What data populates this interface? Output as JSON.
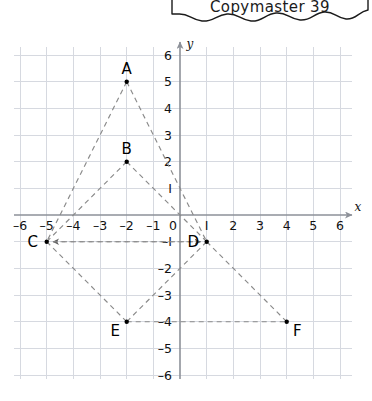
{
  "header": {
    "title": "Copymaster 39",
    "shape": "torn-paper-banner"
  },
  "graph": {
    "axis_labels": {
      "x": "x",
      "y": "y"
    },
    "x_axis": {
      "min": -6,
      "max": 6,
      "ticks": [
        "–6",
        "–5",
        "–4",
        "–3",
        "–2",
        "–1",
        "0",
        "I",
        "2",
        "3",
        "4",
        "5",
        "6"
      ],
      "tick_values": [
        -6,
        -5,
        -4,
        -3,
        -2,
        -1,
        0,
        1,
        2,
        3,
        4,
        5,
        6
      ]
    },
    "y_axis": {
      "min": -6,
      "max": 6,
      "ticks": [
        "6",
        "5",
        "4",
        "3",
        "2",
        "I",
        "–I",
        "–2",
        "–3",
        "–4",
        "–5",
        "–6"
      ],
      "tick_values": [
        6,
        5,
        4,
        3,
        2,
        1,
        -1,
        -2,
        -3,
        -4,
        -5,
        -6
      ]
    },
    "colors": {
      "grid": "#d6d9e0",
      "axis": "#8d9199",
      "dashed_line": "#8a8a8a",
      "point": "#000000",
      "text": "#111111"
    },
    "points": [
      {
        "label": "A",
        "x": -2,
        "y": 5,
        "label_pos": "above"
      },
      {
        "label": "B",
        "x": -2,
        "y": 2,
        "label_pos": "above"
      },
      {
        "label": "C",
        "x": -5,
        "y": -1,
        "label_pos": "left"
      },
      {
        "label": "D",
        "x": 1,
        "y": -1,
        "label_pos": "left"
      },
      {
        "label": "E",
        "x": -2,
        "y": -4,
        "label_pos": "below-left"
      },
      {
        "label": "F",
        "x": 4,
        "y": -4,
        "label_pos": "below-right"
      }
    ],
    "segments": [
      {
        "from": "A",
        "to": "C",
        "arrows": "none"
      },
      {
        "from": "A",
        "to": "D",
        "arrows": "none"
      },
      {
        "from": "B",
        "to": "C",
        "arrows": "none"
      },
      {
        "from": "B",
        "to": "D",
        "arrows": "none"
      },
      {
        "from": "C",
        "to": "E",
        "arrows": "none"
      },
      {
        "from": "D",
        "to": "E",
        "arrows": "none"
      },
      {
        "from": "D",
        "to": "F",
        "arrows": "none"
      },
      {
        "from": "C",
        "to": "D",
        "arrows": "both"
      },
      {
        "from": "E",
        "to": "F",
        "arrows": "none"
      }
    ]
  }
}
